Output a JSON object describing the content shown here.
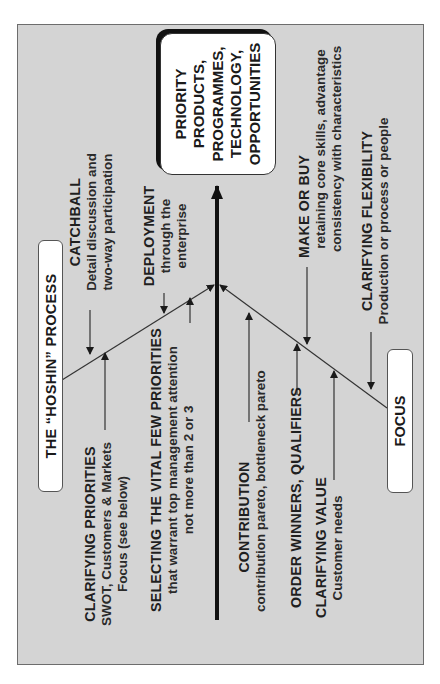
{
  "diagram": {
    "type": "fishbone / converging process diagram (rotated 90° counter-clockwise)",
    "colors": {
      "panel_background": "#d4d4d4",
      "panel_border": "#6d6d6d",
      "box_fill": "#ffffff",
      "main_arrow": "#111111",
      "text": "#1f1f1f"
    },
    "start_box": {
      "label": "THE “HOSHIN” PROCESS"
    },
    "end_box": {
      "label": "FOCUS"
    },
    "target_box": {
      "lines": [
        "PRIORITY",
        "PRODUCTS,",
        "PROGRAMMES,",
        "TECHNOLOGY,",
        "OPPORTUNITIES"
      ]
    },
    "upper_branch": [
      {
        "title": "CATCHBALL",
        "lines": [
          "Detail discussion and",
          "two-way participation"
        ]
      },
      {
        "title": "DEPLOYMENT",
        "lines": [
          "through the",
          "enterprise"
        ]
      },
      {
        "title": "CLARIFYING PRIORITIES",
        "lines": [
          "SWOT, Customers & Markets",
          "Focus (see below)"
        ]
      },
      {
        "title": "SELECTING THE VITAL FEW PRIORITIES",
        "lines": [
          "that warrant top management attention",
          "not more than 2 or 3"
        ]
      }
    ],
    "lower_branch": [
      {
        "title": "CONTRIBUTION",
        "lines": [
          "contribution pareto, bottleneck pareto"
        ]
      },
      {
        "title": "ORDER WINNERS, QUALIFIERS",
        "lines": []
      },
      {
        "title": "CLARIFYING VALUE",
        "lines": [
          "Customer needs"
        ]
      },
      {
        "title": "MAKE OR BUY",
        "lines": [
          "retaining core skills, advantage",
          "consistency with characteristics"
        ]
      },
      {
        "title": "CLARIFYING FLEXIBILITY",
        "lines": [
          "Production or process or people"
        ]
      }
    ]
  }
}
